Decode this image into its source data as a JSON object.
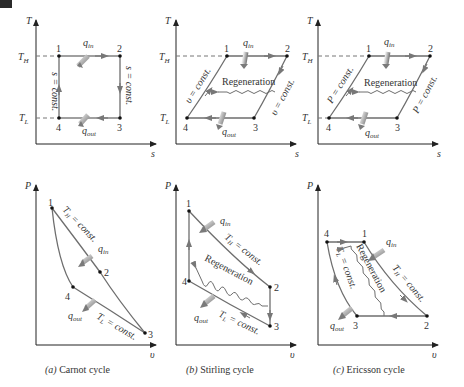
{
  "figure": {
    "panels": [
      {
        "id": "a",
        "caption_letter": "(a)",
        "caption_text": " Carnot cycle",
        "ts": {
          "y_axis": "T",
          "x_axis": "s",
          "TH": "T",
          "TH_sub": "H",
          "TL": "T",
          "TL_sub": "L",
          "points": [
            "1",
            "2",
            "3",
            "4"
          ],
          "q_in": "q",
          "q_in_sub": "in",
          "q_out": "q",
          "q_out_sub": "out",
          "left_label": "s = const.",
          "right_label": "s = const."
        },
        "pv": {
          "y_axis": "P",
          "x_axis": "υ",
          "points": [
            "1",
            "2",
            "3",
            "4"
          ],
          "top_label": "T_H = const.",
          "top_label_main": "T",
          "top_label_sub": "H",
          "top_label_rest": " = const.",
          "bottom_label_main": "T",
          "bottom_label_sub": "L",
          "bottom_label_rest": " = const.",
          "q_in": "q",
          "q_in_sub": "in",
          "q_out": "q",
          "q_out_sub": "out"
        }
      },
      {
        "id": "b",
        "caption_letter": "(b)",
        "caption_text": " Stirling cycle",
        "ts": {
          "y_axis": "T",
          "x_axis": "s",
          "TH": "T",
          "TH_sub": "H",
          "TL": "T",
          "TL_sub": "L",
          "points": [
            "1",
            "2",
            "3",
            "4"
          ],
          "q_in": "q",
          "q_in_sub": "in",
          "q_out": "q",
          "q_out_sub": "out",
          "left_label": "υ = const.",
          "right_label": "υ = const.",
          "regeneration": "Regeneration"
        },
        "pv": {
          "y_axis": "P",
          "x_axis": "υ",
          "points": [
            "1",
            "2",
            "3",
            "4"
          ],
          "top_label_main": "T",
          "top_label_sub": "H",
          "top_label_rest": " = const.",
          "bottom_label_main": "T",
          "bottom_label_sub": "L",
          "bottom_label_rest": " = const.",
          "q_in": "q",
          "q_in_sub": "in",
          "q_out": "q",
          "q_out_sub": "out",
          "regeneration": "Regeneration"
        }
      },
      {
        "id": "c",
        "caption_letter": "(c)",
        "caption_text": " Ericsson cycle",
        "ts": {
          "y_axis": "T",
          "x_axis": "s",
          "TH": "T",
          "TH_sub": "H",
          "TL": "T",
          "TL_sub": "L",
          "points": [
            "1",
            "2",
            "3",
            "4"
          ],
          "q_in": "q",
          "q_in_sub": "in",
          "q_out": "q",
          "q_out_sub": "out",
          "left_label": "P = const.",
          "right_label": "P = const.",
          "regeneration": "Regeneration"
        },
        "pv": {
          "y_axis": "P",
          "x_axis": "υ",
          "points": [
            "1",
            "2",
            "3",
            "4"
          ],
          "top_label_main": "T",
          "top_label_sub": "H",
          "top_label_rest": " = const.",
          "left_label_main": "T",
          "left_label_sub": "L",
          "left_label_rest": " = const.",
          "q_in": "q",
          "q_in_sub": "in",
          "q_out": "q",
          "q_out_sub": "out",
          "regeneration": "Regeneration"
        }
      }
    ]
  },
  "colors": {
    "axis": "#333333",
    "curve": "#6e6e6e",
    "arrow_head": "#777777",
    "heat_arrow": "#8a8a8a",
    "dash": "#777777"
  }
}
